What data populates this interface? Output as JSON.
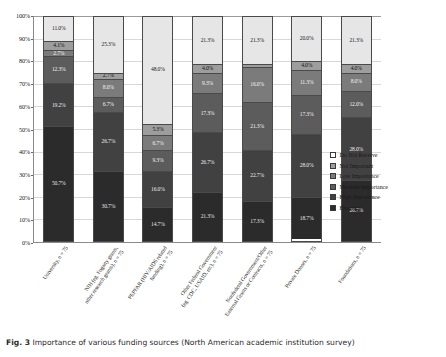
{
  "figure": {
    "label": "Fig. 3",
    "caption": "Importance of various funding sources (North American academic institution survey)"
  },
  "chart_data": {
    "type": "bar",
    "subtype": "stacked-percent-bar",
    "title": "",
    "xlabel": "",
    "ylabel": "",
    "ylim": [
      0,
      100
    ],
    "yticks": [
      "0%",
      "10%",
      "20%",
      "30%",
      "40%",
      "50%",
      "60%",
      "70%",
      "80%",
      "90%",
      "100%"
    ],
    "grid": true,
    "legend_position": "right",
    "categories": [
      "University, n = 75",
      "NIH (eg. Fogarty grants, other research grants), n = 75",
      "PEPFAR (HIV/AIDS related funding), n = 75",
      "Other Federal Government (eg. CDC, USAID, etc), n = 75",
      "Nonfederal Government/Other External Grants or Contracts, n = 75",
      "Private Donors, n = 75",
      "Foundations, n = 75"
    ],
    "category_lines": [
      [
        "University, n = 75"
      ],
      [
        "NIH (eg. Fogarty grants,",
        "other research grants), n = 75"
      ],
      [
        "PEPFAR (HIV/AIDS related",
        "funding), n = 75"
      ],
      [
        "Other Federal Government",
        "(eg. CDC, USAID, etc), n = 75"
      ],
      [
        "Nonfederal Government/Other",
        "External Grants or Contracts, n = 75"
      ],
      [
        "Private Donors, n = 75"
      ],
      [
        "Foundations, n = 75"
      ]
    ],
    "series": [
      {
        "name": "Do Not Receive",
        "color": "#e6e6e6",
        "values": [
          11.0,
          25.3,
          48.0,
          21.3,
          21.3,
          20.0,
          21.3
        ]
      },
      {
        "name": "Not Important",
        "color": "#9d9d9d",
        "values": [
          4.1,
          2.7,
          5.3,
          4.0,
          1.3,
          4.0,
          4.0
        ]
      },
      {
        "name": "Low Importance",
        "color": "#7b7b7b",
        "values": [
          2.7,
          8.0,
          6.7,
          9.3,
          16.0,
          11.3,
          8.0
        ]
      },
      {
        "name": "Medium Importance",
        "color": "#5c5c5c",
        "values": [
          12.3,
          6.7,
          9.3,
          17.3,
          21.3,
          17.3,
          12.0
        ]
      },
      {
        "name": "High Importance",
        "color": "#414141",
        "values": [
          19.2,
          26.7,
          16.0,
          26.7,
          22.7,
          28.0,
          28.0
        ]
      },
      {
        "name": "Essential",
        "color": "#2b2b2b",
        "values": [
          50.7,
          30.7,
          14.7,
          21.3,
          17.3,
          18.7,
          26.7
        ]
      }
    ],
    "labels": [
      [
        "11.0%",
        "4.1%",
        "2.7%",
        "12.3%",
        "19.2%",
        "50.7%"
      ],
      [
        "25.3%",
        "2.7%",
        "8.0%",
        "6.7%",
        "26.7%",
        "30.7%"
      ],
      [
        "48.0%",
        "5.3%",
        "6.7%",
        "9.3%",
        "16.0%",
        "14.7%"
      ],
      [
        "21.3%",
        "4.0%",
        "9.3%",
        "17.3%",
        "26.7%",
        "21.3%"
      ],
      [
        "21.3%",
        "1.3%",
        "16.0%",
        "21.3%",
        "22.7%",
        "17.3%"
      ],
      [
        "20.0%",
        "4.0%",
        "11.3%",
        "17.3%",
        "28.0%",
        "18.7%"
      ],
      [
        "21.3%",
        "4.0%",
        "8.0%",
        "12.0%",
        "28.0%",
        "26.7%"
      ]
    ],
    "legend": [
      "Do Not Receive",
      "Not Important",
      "Low Importance",
      "Medium Importance",
      "High Importance",
      "Essential"
    ]
  }
}
